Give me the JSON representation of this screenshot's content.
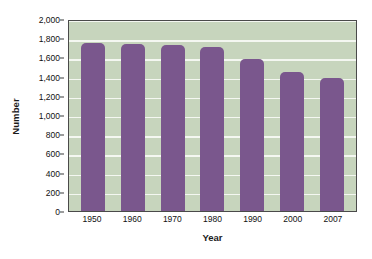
{
  "chart_data": {
    "type": "bar",
    "title": "",
    "xlabel": "Year",
    "ylabel": "Number",
    "categories": [
      "1950",
      "1960",
      "1970",
      "1980",
      "1990",
      "2000",
      "2007"
    ],
    "values": [
      1755,
      1740,
      1730,
      1710,
      1585,
      1450,
      1390
    ],
    "ylim": [
      0,
      2000
    ],
    "yticks": [
      0,
      200,
      400,
      600,
      800,
      1000,
      1200,
      1400,
      1600,
      1800,
      2000
    ],
    "ytick_labels": [
      "0",
      "200",
      "400",
      "600",
      "800",
      "1,000",
      "1,200",
      "1,400",
      "1,600",
      "1,800",
      "2,000"
    ],
    "grid": true,
    "legend": false,
    "series": [
      {
        "name": "Number",
        "values": [
          1755,
          1740,
          1730,
          1710,
          1585,
          1450,
          1390
        ]
      }
    ],
    "colors": {
      "bar": "#7a578d",
      "plot_background": "#c7d5bd",
      "gridline": "#f4f7f1",
      "axis": "#4a4a4a",
      "text": "#111111",
      "page_background": "#ffffff"
    }
  }
}
